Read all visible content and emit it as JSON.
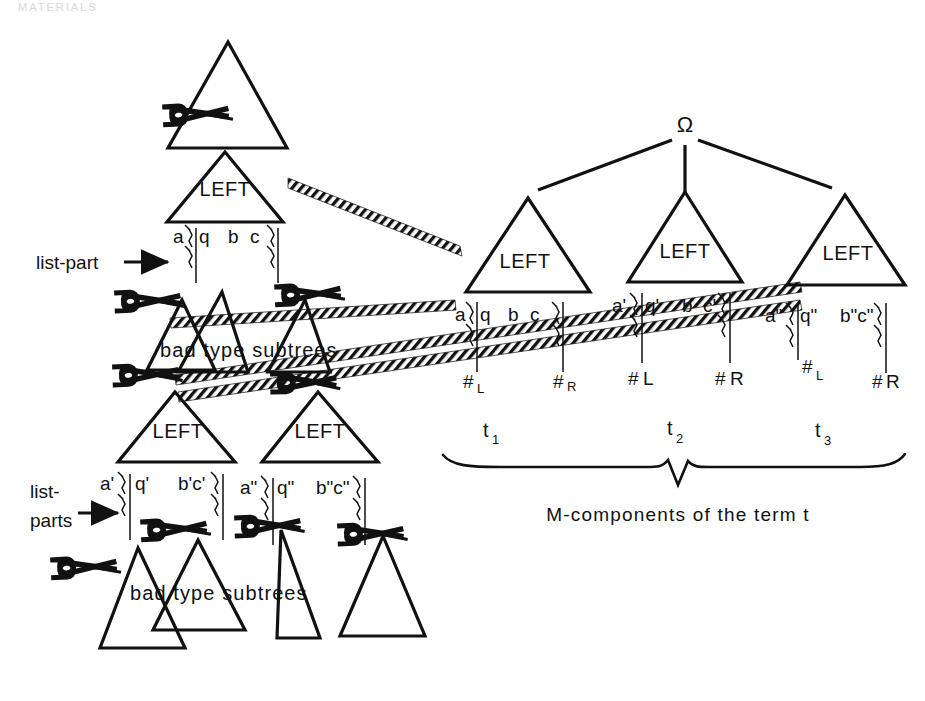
{
  "page": {
    "header_fragment": "MATERIALS",
    "background": "#ffffff",
    "ink": "#111111",
    "width": 925,
    "height": 701
  },
  "left_panel": {
    "annotations": {
      "list_part": "list-part",
      "list_parts_line1": "list-",
      "list_parts_line2": "parts",
      "bad_type_subtrees_upper": "bad type subtrees",
      "bad_type_subtrees_lower": "bad type subtrees"
    },
    "triangles": [
      {
        "label": "",
        "id": "outer-root"
      },
      {
        "label": "LEFT",
        "id": "left-root"
      },
      {
        "label": "LEFT",
        "id": "left-mid-a"
      },
      {
        "label": "LEFT",
        "id": "left-low-a"
      },
      {
        "label": "LEFT",
        "id": "left-low-b"
      }
    ],
    "leaf_rows": [
      {
        "id": "row-root",
        "items": [
          "a",
          "q",
          "b",
          "c"
        ]
      },
      {
        "id": "row-low-a",
        "items": [
          "a'",
          "q'",
          "b'c'"
        ]
      },
      {
        "id": "row-low-b",
        "items": [
          "a\"",
          "q\"",
          "b\"c\""
        ]
      }
    ],
    "scissors_count": 9
  },
  "right_panel": {
    "root_symbol": "Ω",
    "components": [
      {
        "triangle_label": "LEFT",
        "term": "t",
        "term_sub": "1",
        "leaves": [
          "a",
          "q",
          "b",
          "c"
        ],
        "markers": [
          {
            "text": "#",
            "sub": "L"
          },
          {
            "text": "#",
            "sub": "R"
          }
        ]
      },
      {
        "triangle_label": "LEFT",
        "term": "t",
        "term_sub": "2",
        "leaves": [
          "a'",
          "q'",
          "b",
          "c'"
        ],
        "markers": [
          {
            "text": "#",
            "sub": "L"
          },
          {
            "text": "#",
            "sub": "R"
          }
        ]
      },
      {
        "triangle_label": "LEFT",
        "term": "t",
        "term_sub": "3",
        "leaves": [
          "a\"",
          "q\"",
          "b\"c\""
        ],
        "markers": [
          {
            "text": "#",
            "sub": "L"
          },
          {
            "text": "#",
            "sub": "R"
          }
        ]
      }
    ],
    "brace_caption": "M-components of the term t"
  }
}
